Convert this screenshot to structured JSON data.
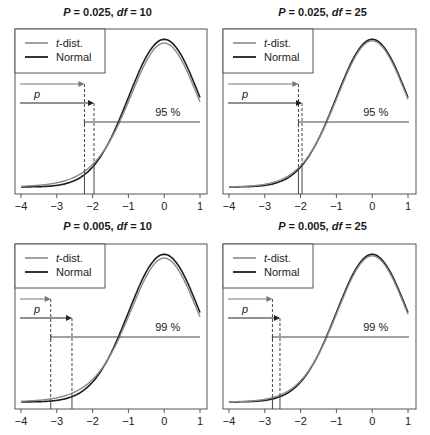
{
  "chart_data": [
    {
      "type": "line",
      "title": "P = 0.025, df = 10",
      "title_parts": {
        "p_label": "P",
        "p_value": "= 0.025,",
        "df_label": "df",
        "df_value": "= 10"
      },
      "P": 0.025,
      "df": 10,
      "xlim": [
        -4,
        1
      ],
      "xticks": [
        "-4",
        "-3",
        "-2",
        "-1",
        "0",
        "1"
      ],
      "legend": {
        "position": "top-left",
        "entries": [
          {
            "label_italic": "t",
            "label_rest": "-dist.",
            "color": "#8a8a8a"
          },
          {
            "label": "Normal",
            "color": "#1e1e1e"
          }
        ]
      },
      "series": [
        {
          "name": "t-dist.",
          "critical": -2.228
        },
        {
          "name": "Normal",
          "critical": -1.96
        }
      ],
      "annotations": {
        "p_label": "p",
        "coverage_label": "95 %"
      }
    },
    {
      "type": "line",
      "title": "P = 0.025, df = 25",
      "title_parts": {
        "p_label": "P",
        "p_value": "= 0.025,",
        "df_label": "df",
        "df_value": "= 25"
      },
      "P": 0.025,
      "df": 25,
      "xlim": [
        -4,
        1
      ],
      "xticks": [
        "-4",
        "-3",
        "-2",
        "-1",
        "0",
        "1"
      ],
      "legend": {
        "position": "top-left",
        "entries": [
          {
            "label_italic": "t",
            "label_rest": "-dist.",
            "color": "#8a8a8a"
          },
          {
            "label": "Normal",
            "color": "#1e1e1e"
          }
        ]
      },
      "series": [
        {
          "name": "t-dist.",
          "critical": -2.06
        },
        {
          "name": "Normal",
          "critical": -1.96
        }
      ],
      "annotations": {
        "p_label": "p",
        "coverage_label": "95 %"
      }
    },
    {
      "type": "line",
      "title": "P = 0.005, df = 10",
      "title_parts": {
        "p_label": "P",
        "p_value": "= 0.005,",
        "df_label": "df",
        "df_value": "= 10"
      },
      "P": 0.005,
      "df": 10,
      "xlim": [
        -4,
        1
      ],
      "xticks": [
        "-4",
        "-3",
        "-2",
        "-1",
        "0",
        "1"
      ],
      "legend": {
        "position": "top-left",
        "entries": [
          {
            "label_italic": "t",
            "label_rest": "-dist.",
            "color": "#8a8a8a"
          },
          {
            "label": "Normal",
            "color": "#1e1e1e"
          }
        ]
      },
      "series": [
        {
          "name": "t-dist.",
          "critical": -3.169
        },
        {
          "name": "Normal",
          "critical": -2.576
        }
      ],
      "annotations": {
        "p_label": "p",
        "coverage_label": "99 %"
      }
    },
    {
      "type": "line",
      "title": "P = 0.005, df = 25",
      "title_parts": {
        "p_label": "P",
        "p_value": "= 0.005,",
        "df_label": "df",
        "df_value": "= 25"
      },
      "P": 0.005,
      "df": 25,
      "xlim": [
        -4,
        1
      ],
      "xticks": [
        "-4",
        "-3",
        "-2",
        "-1",
        "0",
        "1"
      ],
      "legend": {
        "position": "top-left",
        "entries": [
          {
            "label_italic": "t",
            "label_rest": "-dist.",
            "color": "#8a8a8a"
          },
          {
            "label": "Normal",
            "color": "#1e1e1e"
          }
        ]
      },
      "series": [
        {
          "name": "t-dist.",
          "critical": -2.787
        },
        {
          "name": "Normal",
          "critical": -2.576
        }
      ],
      "annotations": {
        "p_label": "p",
        "coverage_label": "99 %"
      }
    }
  ],
  "colors": {
    "t_dist": "#8a8a8a",
    "normal": "#1e1e1e",
    "axis": "#555555"
  }
}
